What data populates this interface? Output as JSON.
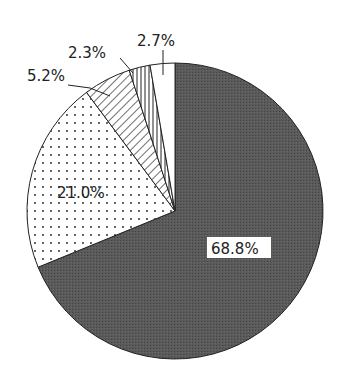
{
  "chart_data": {
    "type": "pie",
    "title": "",
    "start_angle_deg": 0,
    "direction": "clockwise",
    "slices": [
      {
        "label": "68.8%",
        "value": 68.8,
        "fill": "dark-gray-stipple",
        "color": "#555555"
      },
      {
        "label": "21.0%",
        "value": 21.0,
        "fill": "dots",
        "color": "#ffffff"
      },
      {
        "label": "5.2%",
        "value": 5.2,
        "fill": "diagonal-hatch",
        "color": "#ffffff"
      },
      {
        "label": "2.3%",
        "value": 2.3,
        "fill": "vertical-hatch",
        "color": "#ffffff"
      },
      {
        "label": "2.7%",
        "value": 2.7,
        "fill": "white",
        "color": "#ffffff"
      }
    ],
    "labels": {
      "s0": "68.8%",
      "s1": "21.0%",
      "s2": "5.2%",
      "s3": "2.3%",
      "s4": "2.7%"
    }
  }
}
